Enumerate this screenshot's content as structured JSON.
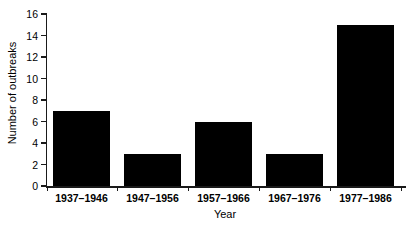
{
  "chart_data": {
    "type": "bar",
    "title": "",
    "subtitle": "",
    "xlabel": "Year",
    "ylabel": "Number of outbreaks",
    "categories": [
      "1937–1946",
      "1947–1956",
      "1957–1966",
      "1967–1976",
      "1977–1986"
    ],
    "values": [
      7,
      3,
      6,
      3,
      15
    ],
    "series": [
      {
        "name": "Number of outbreaks",
        "values": [
          7,
          3,
          6,
          3,
          15
        ]
      }
    ],
    "ylim": [
      0,
      16
    ],
    "ytick_values": [
      0,
      2,
      4,
      6,
      8,
      10,
      12,
      14,
      16
    ],
    "ytick_labels": [
      "0",
      "2",
      "4",
      "6",
      "8",
      "10",
      "12",
      "14",
      "16"
    ],
    "grid": false,
    "legend": false,
    "legend_position": "none",
    "bar_color": "#000000",
    "axis_color": "#1a1a1a",
    "background_color": "#ffffff",
    "annotations": []
  },
  "axes": {
    "y": {
      "label": "Number of outbreaks",
      "ticks": [
        "0",
        "2",
        "4",
        "6",
        "8",
        "10",
        "12",
        "14",
        "16"
      ],
      "min": "0",
      "max": "16"
    },
    "x": {
      "label": "Year",
      "ticks": [
        "1937–1946",
        "1947–1956",
        "1957–1966",
        "1967–1976",
        "1977–1986"
      ]
    }
  }
}
